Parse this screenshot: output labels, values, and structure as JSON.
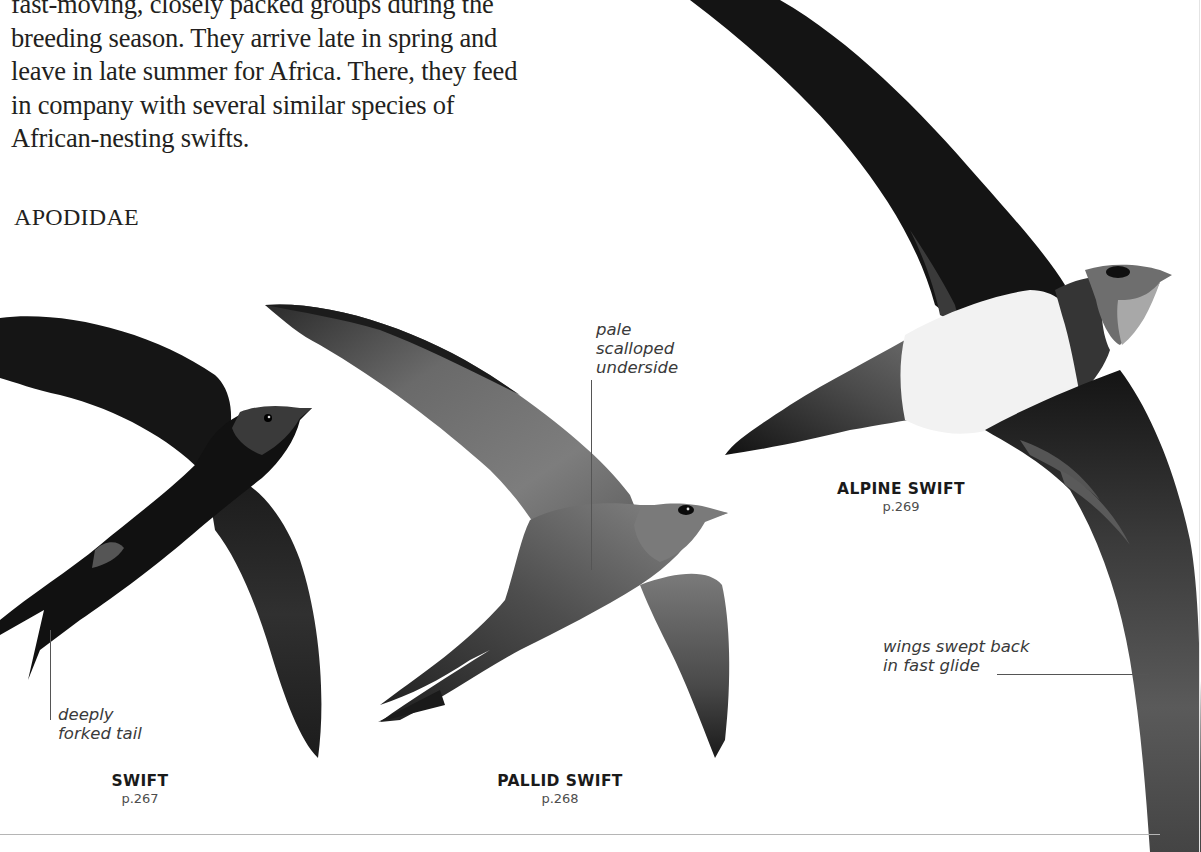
{
  "intro": {
    "lines": [
      "fast-moving, closely packed groups during the",
      "breeding season. They arrive late in spring and",
      "leave in late summer for Africa. There, they feed",
      "in company with several similar species of",
      "African-nesting swifts."
    ]
  },
  "family_heading": "APODIDAE",
  "species": [
    {
      "name": "SWIFT",
      "page": "p.267"
    },
    {
      "name": "PALLID SWIFT",
      "page": "p.268"
    },
    {
      "name": "ALPINE SWIFT",
      "page": "p.269"
    }
  ],
  "annotations": {
    "swift_tail": [
      "deeply",
      "forked tail"
    ],
    "pallid_underside": [
      "pale",
      "scalloped",
      "underside"
    ],
    "alpine_wings": [
      "wings swept back",
      "in fast glide"
    ]
  },
  "colors": {
    "text": "#231f20",
    "swift_body": "#111111",
    "pallid_body": "#4a4a4a",
    "alpine_wing": "#151515",
    "alpine_belly": "#f2f2f2",
    "divider": "#b5b5b5"
  }
}
